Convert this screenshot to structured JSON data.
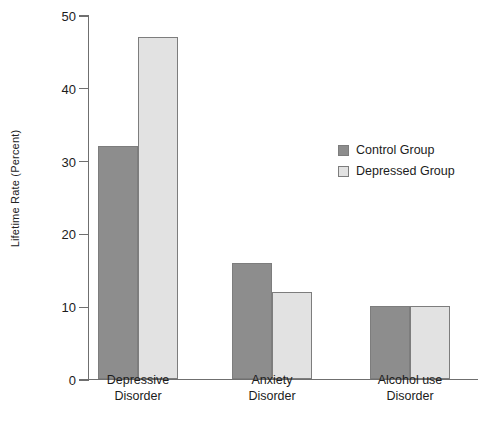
{
  "chart_data": {
    "type": "bar",
    "title": "",
    "xlabel": "",
    "ylabel": "Lifetime Rate (Percent)",
    "categories": [
      "Depressive\nDisorder",
      "Anxiety\nDisorder",
      "Alcohol use\nDisorder"
    ],
    "series": [
      {
        "name": "Control Group",
        "values": [
          32,
          16,
          10
        ],
        "color": "#8d8d8d"
      },
      {
        "name": "Depressed Group",
        "values": [
          47,
          12,
          10
        ],
        "color": "#e2e2e2"
      }
    ],
    "ylim": [
      0,
      50
    ],
    "yticks": [
      0,
      10,
      20,
      30,
      40,
      50
    ],
    "ytick_labels": [
      "0",
      "10",
      "20",
      "30",
      "40",
      "50"
    ],
    "grid": false,
    "legend_position": "center-right"
  },
  "legend": {
    "items": [
      {
        "label": "Control Group"
      },
      {
        "label": "Depressed Group"
      }
    ]
  }
}
